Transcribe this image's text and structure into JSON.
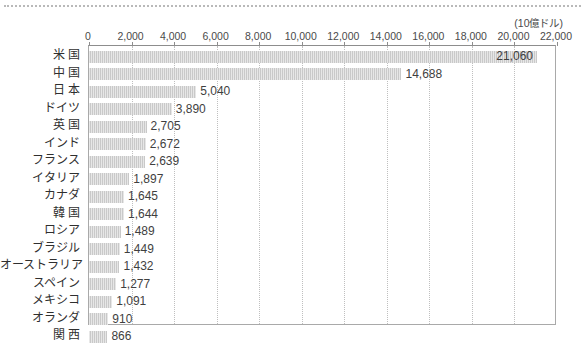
{
  "chart_data": {
    "type": "bar",
    "orientation": "horizontal",
    "title": "",
    "subtitle": "",
    "unit_label": "(10億ドル)",
    "xlabel": "",
    "ylabel": "",
    "xlim": [
      0,
      22000
    ],
    "xticks": [
      0,
      2000,
      4000,
      6000,
      8000,
      10000,
      12000,
      14000,
      16000,
      18000,
      20000,
      22000
    ],
    "xtick_labels": [
      "0",
      "2,000",
      "4,000",
      "6,000",
      "8,000",
      "10,000",
      "12,000",
      "14,000",
      "16,000",
      "18,000",
      "20,000",
      "22,000"
    ],
    "grid": "vertical-dotted",
    "legend": "none",
    "bar_color": "#c9c9c9",
    "categories": [
      "米 国",
      "中 国",
      "日 本",
      "ドイツ",
      "英 国",
      "インド",
      "フランス",
      "イタリア",
      "カナダ",
      "韓 国",
      "ロシア",
      "ブラジル",
      "オーストラリア",
      "スペイン",
      "メキシコ",
      "オランダ",
      "関 西"
    ],
    "values": [
      21060,
      14688,
      5040,
      3890,
      2705,
      2672,
      2639,
      1897,
      1645,
      1644,
      1489,
      1449,
      1432,
      1277,
      1091,
      910,
      866
    ],
    "value_labels": [
      "21,060",
      "14,688",
      "5,040",
      "3,890",
      "2,705",
      "2,672",
      "2,639",
      "1,897",
      "1,645",
      "1,644",
      "1,489",
      "1,449",
      "1,432",
      "1,277",
      "1,091",
      "910",
      "866"
    ],
    "label_placement": [
      "inside-end",
      "outside-end",
      "outside-end",
      "outside-end",
      "outside-end",
      "outside-end",
      "outside-end",
      "outside-end",
      "outside-end",
      "outside-end",
      "outside-end",
      "outside-end",
      "outside-end",
      "outside-end",
      "outside-end",
      "outside-end",
      "outside-end"
    ]
  }
}
